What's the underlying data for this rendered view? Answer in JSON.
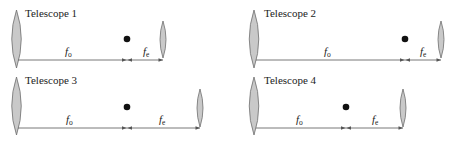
{
  "diagram": {
    "type": "optics-schematic",
    "colors": {
      "lens_fill": "#c9c9c9",
      "lens_stroke": "#6e6e6e",
      "axis": "#6a6a6a",
      "focal_point": "#111111"
    },
    "telescopes": [
      {
        "title": "Telescope 1",
        "objective_label": "f",
        "objective_sub": "o",
        "eyepiece_label": "f",
        "eyepiece_sub": "e",
        "objective_x": 16,
        "focal_x": 127,
        "eyepiece_x": 163,
        "axis_y": 60,
        "dot_y": 39,
        "top": 0
      },
      {
        "title": "Telescope 2",
        "objective_label": "f",
        "objective_sub": "o",
        "eyepiece_label": "f",
        "eyepiece_sub": "e",
        "objective_x": 254,
        "focal_x": 405,
        "eyepiece_x": 441,
        "axis_y": 60,
        "dot_y": 39,
        "top": 0
      },
      {
        "title": "Telescope 3",
        "objective_label": "f",
        "objective_sub": "o",
        "eyepiece_label": "f",
        "eyepiece_sub": "e",
        "objective_x": 16,
        "focal_x": 127,
        "eyepiece_x": 200,
        "axis_y": 128,
        "dot_y": 107,
        "top": 68
      },
      {
        "title": "Telescope 4",
        "objective_label": "f",
        "objective_sub": "o",
        "eyepiece_label": "f",
        "eyepiece_sub": "e",
        "objective_x": 254,
        "focal_x": 346,
        "eyepiece_x": 403,
        "axis_y": 128,
        "dot_y": 107,
        "top": 68
      }
    ]
  }
}
